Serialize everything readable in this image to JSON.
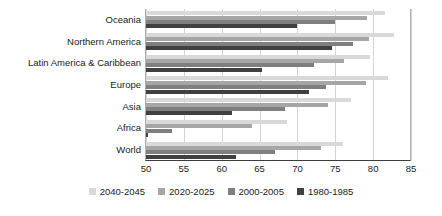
{
  "chart_data": {
    "type": "bar",
    "orientation": "horizontal",
    "title": "",
    "xlabel": "",
    "ylabel": "",
    "xlim": [
      50,
      85
    ],
    "xticks": [
      50,
      55,
      60,
      65,
      70,
      75,
      80,
      85
    ],
    "grid": true,
    "legend_position": "bottom",
    "categories": [
      "Oceania",
      "Northern America",
      "Latin America & Caribbean",
      "Europe",
      "Asia",
      "Africa",
      "World"
    ],
    "series": [
      {
        "name": "2040-2045",
        "color": "#d9d9d9",
        "values": [
          81.6,
          82.7,
          79.6,
          82.0,
          77.1,
          68.6,
          76.0
        ]
      },
      {
        "name": "2020-2025",
        "color": "#a6a6a6",
        "values": [
          79.2,
          79.4,
          76.1,
          79.0,
          74.1,
          64.0,
          73.1
        ]
      },
      {
        "name": "2000-2005",
        "color": "#7f7f7f",
        "values": [
          75.0,
          77.3,
          72.2,
          73.8,
          68.3,
          53.4,
          67.0
        ]
      },
      {
        "name": "1980-1985",
        "color": "#404040",
        "values": [
          69.9,
          74.5,
          65.3,
          71.5,
          61.4,
          50.3,
          61.9
        ]
      }
    ]
  },
  "legend": {
    "items": [
      {
        "label": "2040-2045"
      },
      {
        "label": "2020-2025"
      },
      {
        "label": "2000-2005"
      },
      {
        "label": "1980-1985"
      }
    ]
  }
}
